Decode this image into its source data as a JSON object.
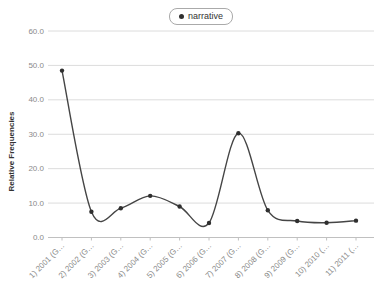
{
  "colors": {
    "background": "#ffffff",
    "grid": "#dcdcdc",
    "axis": "#c0c0c0",
    "tick_label": "#8a8a8a",
    "axis_title": "#333333",
    "line": "#454545",
    "marker": "#2f2f2f",
    "legend_border": "#aaaaaa",
    "legend_text": "#333333"
  },
  "chart_data": {
    "type": "line",
    "title": "",
    "xlabel": "",
    "ylabel": "Relative Frequencies",
    "ylim": [
      0,
      60
    ],
    "y_tick_values": [
      60,
      50,
      40,
      30,
      20,
      10,
      0
    ],
    "y_tick_labels": [
      "60.0",
      "50.0",
      "40.0",
      "30.0",
      "20.0",
      "10.0",
      "0.0"
    ],
    "categories": [
      "1) 2001 (G…",
      "2) 2002 (G…",
      "3) 2003 (G…",
      "4) 2004 (G…",
      "5) 2005 (G…",
      "6) 2006 (G…",
      "7) 2007 (G…",
      "8) 2008 (G…",
      "9) 2009 (G…",
      "10) 2010 (…",
      "11) 2011 (…"
    ],
    "grid": "horizontal",
    "legend_position": "top-center",
    "series": [
      {
        "name": "narrative",
        "values": [
          48.5,
          7.5,
          8.5,
          12.1,
          9.0,
          4.2,
          30.3,
          7.9,
          4.8,
          4.3,
          4.9
        ]
      }
    ]
  }
}
